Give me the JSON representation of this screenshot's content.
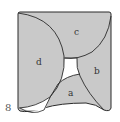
{
  "figure": {
    "number": "8",
    "regions": [
      {
        "id": "a",
        "label": "a"
      },
      {
        "id": "b",
        "label": "b"
      },
      {
        "id": "c",
        "label": "c"
      },
      {
        "id": "d",
        "label": "d"
      }
    ],
    "colors": {
      "fill": "#c9c9c9",
      "stroke": "#2b2b2b",
      "gap": "#ffffff"
    }
  }
}
